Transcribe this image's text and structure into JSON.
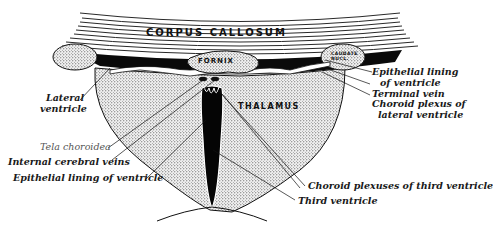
{
  "diagram": {
    "type": "anatomical-coronal-section",
    "structures": {
      "corpus_callosum": "CORPUS CALLOSUM",
      "fornix": "FORNIX",
      "thalamus": "THALAMUS",
      "caudate": "CAUDATE NUCL."
    },
    "labels": {
      "lateral_ventricle_line1": "Lateral",
      "lateral_ventricle_line2": "ventricle",
      "tela_choroidea": "Tela choroidea",
      "internal_cerebral_veins": "Internal cerebral veins",
      "epithelial_lining_left": "Epithelial lining of ventricle",
      "epithelial_lining_right_line1": "Epithelial lining",
      "epithelial_lining_right_line2": "of ventricle",
      "terminal_vein": "Terminal vein",
      "choroid_plexus_lateral_line1": "Choroid plexus of",
      "choroid_plexus_lateral_line2": "lateral ventricle",
      "choroid_plexuses_third": "Choroid plexuses of third ventricle",
      "third_ventricle": "Third ventricle"
    },
    "colors": {
      "ink": "#111111",
      "paper": "#ffffff",
      "stipple": "#e6e6e6",
      "label_light": "#555555"
    }
  }
}
